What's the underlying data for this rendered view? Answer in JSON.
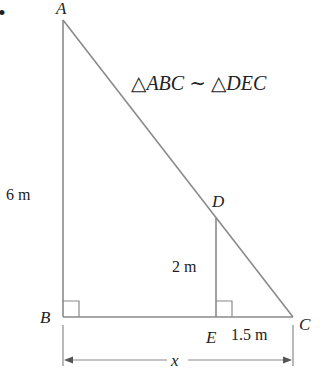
{
  "diagram": {
    "points": {
      "A": {
        "label": "A"
      },
      "B": {
        "label": "B"
      },
      "C": {
        "label": "C"
      },
      "D": {
        "label": "D"
      },
      "E": {
        "label": "E"
      }
    },
    "measurements": {
      "AB": "6 m",
      "DE": "2 m",
      "EC": "1.5 m",
      "BC": "x"
    },
    "similarity_statement": "△ABC ∼ △DEC",
    "bullet": "•",
    "colors": {
      "line": "#8a8a8a",
      "text": "#222222"
    }
  }
}
